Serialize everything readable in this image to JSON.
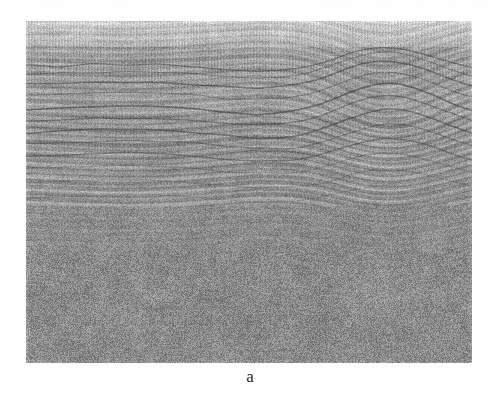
{
  "figure": {
    "label": "a",
    "kind": "seismic-reflection-profile",
    "panel": {
      "x": 26,
      "y": 21,
      "width": 446,
      "height": 342,
      "background_hex": "#9a9a9a"
    },
    "page_background_hex": "#ffffff",
    "ink_hex": "#2b2b2b"
  },
  "chart_data": {
    "type": "heatmap",
    "title": "",
    "subtitle": "",
    "xlabel": "",
    "ylabel": "",
    "colormap": "grayscale",
    "grid": false,
    "legend_position": "none",
    "xlim": [
      0,
      446
    ],
    "ylim": [
      0,
      342
    ],
    "annotations": [
      "a"
    ],
    "zones": [
      {
        "name": "upper-trace-band",
        "y_range": [
          0,
          26
        ],
        "description": "dense fine vertical seismic traces with strong horizontal layering, light tone",
        "mean_gray": 186,
        "contrast": 0.55,
        "lineation": "horizontal",
        "trace_spacing_px": 3
      },
      {
        "name": "layered-reflectors",
        "y_range": [
          26,
          95
        ],
        "description": "continuous sub-horizontal high-amplitude reflectors, gently dipping right",
        "mean_gray": 168,
        "contrast": 0.72,
        "lineation": "horizontal",
        "trace_spacing_px": 3
      },
      {
        "name": "clinoform-package",
        "y_range": [
          95,
          185
        ],
        "description": "inclined clinoform reflectors dipping left-to-right, converging toward a structural arch on the right",
        "mean_gray": 158,
        "contrast": 0.8,
        "lineation": "dipping",
        "trace_spacing_px": 3
      },
      {
        "name": "transition-zone",
        "y_range": [
          185,
          230
        ],
        "description": "weak discontinuous reflectors fading into incoherent noise",
        "mean_gray": 152,
        "contrast": 0.45,
        "lineation": "weak-horizontal",
        "trace_spacing_px": 3
      },
      {
        "name": "chaotic-basement",
        "y_range": [
          230,
          342
        ],
        "description": "incoherent mid-gray speckle, no continuous reflectors",
        "mean_gray": 150,
        "contrast": 0.3,
        "lineation": "none",
        "trace_spacing_px": 3
      }
    ],
    "structures": [
      {
        "name": "anticline-arch",
        "center_x": 345,
        "center_y": 72,
        "half_width": 70,
        "amplitude": 16,
        "description": "broad arched reflector culmination in upper-right of section"
      },
      {
        "name": "right-flank-dipping-reflectors",
        "center_x": 380,
        "center_y": 105,
        "half_width": 90,
        "amplitude": 26,
        "description": "steeply dipping high-amplitude reflectors on the right flank"
      },
      {
        "name": "left-clinoform-set",
        "center_x": 120,
        "center_y": 130,
        "half_width": 130,
        "amplitude": 10,
        "description": "gently right-dipping clinoform reflector set on the left half"
      }
    ]
  }
}
